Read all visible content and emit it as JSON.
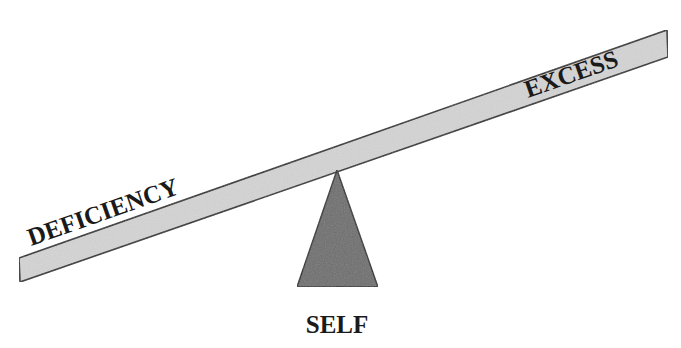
{
  "diagram": {
    "type": "seesaw-balance",
    "labels": {
      "left": "DEFICIENCY",
      "right": "EXCESS",
      "fulcrum": "SELF"
    },
    "colors": {
      "beam_fill": "#d4d4d4",
      "fulcrum_fill": "#6e6e6e",
      "outline": "#2a2a2a",
      "text": "#1a1a1a"
    }
  }
}
